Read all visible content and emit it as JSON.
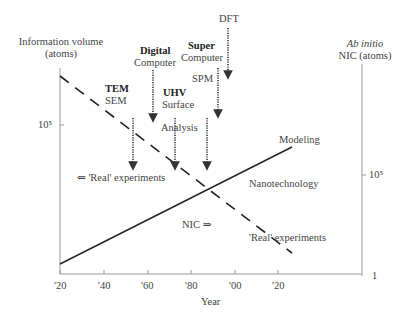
{
  "diagram": {
    "left_axis": {
      "title_line1": "Information volume",
      "title_line2": "(atoms)",
      "tick_label": "10⁵"
    },
    "right_axis": {
      "title_line1": "Ab initio",
      "title_line2": "NIC (atoms)",
      "tick_label": "10⁵",
      "bottom_label": "1"
    },
    "x_axis": {
      "title": "Year",
      "ticks": [
        "'20",
        "'40",
        "'60",
        "'80",
        "'00",
        "'20"
      ]
    },
    "annotations": {
      "tem_bold": "TEM",
      "tem_sub": "SEM",
      "digital_bold": "Digital",
      "digital_sub": "Computer",
      "uhv_bold": "UHV",
      "uhv_sub": "Surface",
      "uhv_sub2": "Analysis",
      "super_bold": "Super",
      "super_sub": "Computer",
      "spm": "SPM",
      "dft": "DFT",
      "modeling": "Modeling",
      "nanotechnology": "Nanotechnology",
      "real_experiments_left": "⇐ 'Real' experiments",
      "real_experiments_right": "'Real' experiments",
      "nic_arrow": "NIC ⇒"
    },
    "colors": {
      "axis": "#888888",
      "line": "#222222",
      "text": "#444444"
    }
  }
}
